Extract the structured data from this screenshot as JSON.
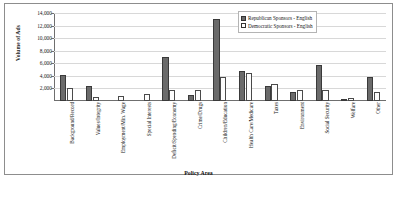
{
  "chart_data": {
    "type": "bar",
    "title": "",
    "xlabel": "Policy Area",
    "ylabel": "Volume of Ads",
    "ylim": [
      0,
      14000
    ],
    "ytick_labels": [
      "2,000",
      "4,000",
      "6,000",
      "8,000",
      "10,000",
      "12,000",
      "14,000"
    ],
    "ytick_values": [
      2000,
      4000,
      6000,
      8000,
      10000,
      12000,
      14000
    ],
    "grid": true,
    "legend_position": "top-right",
    "categories": [
      "Background/Record",
      "Values/Integrity",
      "Employment/Min. Wage",
      "Special Interests",
      "Deficit/Spending/Economy",
      "Crime/Drugs",
      "Children/Education",
      "Health Care/Medicare",
      "Taxes",
      "Environment",
      "Social Security",
      "Welfare",
      "Other"
    ],
    "series": [
      {
        "name": "Republican Sponsors - English",
        "values": [
          4100,
          2400,
          0,
          0,
          7000,
          950,
          13100,
          4700,
          2400,
          1400,
          5800,
          300,
          3900
        ]
      },
      {
        "name": "Democratic Sponsors - English",
        "values": [
          2100,
          700,
          750,
          1100,
          1700,
          1700,
          3900,
          4400,
          2700,
          1800,
          1700,
          500,
          1500
        ]
      }
    ]
  },
  "legend": {
    "items": [
      {
        "label": "Republican Sponsors - English",
        "color": "#6b6b6b"
      },
      {
        "label": "Democratic Sponsors - English",
        "color": "#ffffff"
      }
    ]
  },
  "axes": {
    "y_title": "Volume of Ads",
    "x_title": "Policy Area"
  }
}
